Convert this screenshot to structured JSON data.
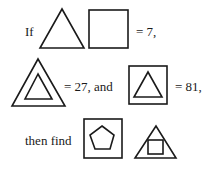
{
  "puzzle": {
    "line1": {
      "prefix": "If",
      "result": "= 7,"
    },
    "line2": {
      "middle": "= 27, and",
      "result": "= 81,"
    },
    "line3": {
      "prefix": "then find"
    }
  },
  "colors": {
    "stroke": "#1a1a1a",
    "background": "#ffffff"
  }
}
